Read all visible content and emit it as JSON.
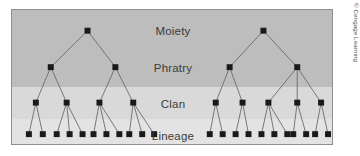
{
  "figure": {
    "credit": "© Cengage Learning",
    "frame": {
      "border_color": "#8f8f8f",
      "background": "#d8d8d8"
    }
  },
  "levels": [
    {
      "id": "moiety",
      "label": "Moiety",
      "label_x": 161,
      "label_y": 21,
      "band_top": 0,
      "band_height": 48,
      "band_color": "#bdbdbd"
    },
    {
      "id": "phratry",
      "label": "Phratry",
      "label_x": 161,
      "label_y": 58,
      "band_top": 48,
      "band_height": 29,
      "band_color": "#bdbdbd"
    },
    {
      "id": "clan",
      "label": "Clan",
      "label_x": 161,
      "label_y": 94,
      "band_top": 77,
      "band_height": 32,
      "band_color": "#d9d9d9"
    },
    {
      "id": "lineage",
      "label": "Lineage",
      "label_x": 161,
      "label_y": 126,
      "band_top": 109,
      "band_height": 27,
      "band_color": "#e3e3e3"
    }
  ],
  "node_style": {
    "size": 6,
    "color": "#1a1a1a",
    "edge_color": "#6a6a6a",
    "edge_width": 0.9
  },
  "chart_data": {
    "type": "diagram",
    "level_names": [
      "Moiety",
      "Phratry",
      "Clan",
      "Lineage"
    ],
    "level_y": [
      21,
      58,
      94,
      126
    ],
    "trees": [
      {
        "name": "left-moiety",
        "moiety": {
          "x": 76,
          "y": 21
        },
        "phratries": [
          {
            "x": 39,
            "y": 58,
            "clans": [
              {
                "x": 24,
                "y": 94,
                "lineages": [
                  {
                    "x": 17,
                    "y": 126
                  },
                  {
                    "x": 31,
                    "y": 126
                  }
                ]
              },
              {
                "x": 55,
                "y": 94,
                "lineages": [
                  {
                    "x": 45,
                    "y": 126
                  },
                  {
                    "x": 58,
                    "y": 126
                  },
                  {
                    "x": 71,
                    "y": 126
                  }
                ]
              }
            ]
          },
          {
            "x": 104,
            "y": 58,
            "clans": [
              {
                "x": 88,
                "y": 94,
                "lineages": [
                  {
                    "x": 82,
                    "y": 126
                  },
                  {
                    "x": 95,
                    "y": 126
                  },
                  {
                    "x": 108,
                    "y": 126
                  }
                ]
              },
              {
                "x": 122,
                "y": 94,
                "lineages": [
                  {
                    "x": 118,
                    "y": 126
                  },
                  {
                    "x": 131,
                    "y": 126
                  },
                  {
                    "x": 143,
                    "y": 126
                  }
                ]
              }
            ]
          }
        ]
      },
      {
        "name": "right-moiety",
        "moiety": {
          "x": 253,
          "y": 21
        },
        "phratries": [
          {
            "x": 219,
            "y": 58,
            "clans": [
              {
                "x": 205,
                "y": 94,
                "lineages": [
                  {
                    "x": 199,
                    "y": 126
                  },
                  {
                    "x": 212,
                    "y": 126
                  }
                ]
              },
              {
                "x": 232,
                "y": 94,
                "lineages": [
                  {
                    "x": 225,
                    "y": 126
                  },
                  {
                    "x": 238,
                    "y": 126
                  }
                ]
              }
            ]
          },
          {
            "x": 287,
            "y": 58,
            "clans": [
              {
                "x": 258,
                "y": 94,
                "lineages": [
                  {
                    "x": 251,
                    "y": 126
                  },
                  {
                    "x": 264,
                    "y": 126
                  },
                  {
                    "x": 277,
                    "y": 126
                  }
                ]
              },
              {
                "x": 287,
                "y": 94,
                "lineages": [
                  {
                    "x": 283,
                    "y": 126
                  },
                  {
                    "x": 296,
                    "y": 126
                  }
                ]
              },
              {
                "x": 311,
                "y": 94,
                "lineages": [
                  {
                    "x": 305,
                    "y": 126
                  },
                  {
                    "x": 318,
                    "y": 126
                  }
                ]
              }
            ]
          }
        ]
      }
    ],
    "counts": {
      "moieties": 2,
      "phratries": 4,
      "clans": 9,
      "lineages": 22
    }
  }
}
